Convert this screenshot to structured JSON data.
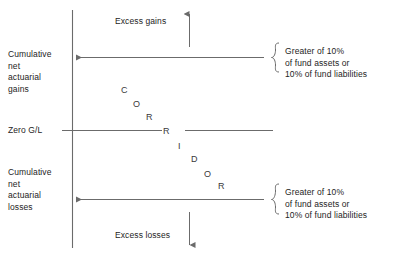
{
  "diagram": {
    "axis": {
      "vertical_axis_name": "cumulative-net-actuarial-gain-loss-axis",
      "zero_line_label": "Zero G/L"
    },
    "direction_labels": {
      "top": "Excess gains",
      "bottom": "Excess losses"
    },
    "boundary_labels": {
      "upper": "Cumulative\nnet\nactuarial\ngains",
      "lower": "Cumulative\nnet\nactuarial\nlosses"
    },
    "annotations": {
      "upper_brace": "Greater of 10%\nof fund assets or\n10% of fund liabilities",
      "lower_brace": "Greater of 10%\nof fund assets or\n10% of fund liabilities"
    },
    "corridor_word": "CORRIDOR",
    "corridor_letters": [
      {
        "char": "C",
        "x": 121,
        "y": 86
      },
      {
        "char": "O",
        "x": 133,
        "y": 100
      },
      {
        "char": "R",
        "x": 146,
        "y": 113
      },
      {
        "char": "R",
        "x": 163,
        "y": 127
      },
      {
        "char": "I",
        "x": 178,
        "y": 142
      },
      {
        "char": "D",
        "x": 191,
        "y": 155
      },
      {
        "char": "O",
        "x": 204,
        "y": 170
      },
      {
        "char": "R",
        "x": 218,
        "y": 182
      }
    ],
    "colors": {
      "line": "#6b6b6b",
      "text": "#242424",
      "background": "#ffffff"
    }
  }
}
